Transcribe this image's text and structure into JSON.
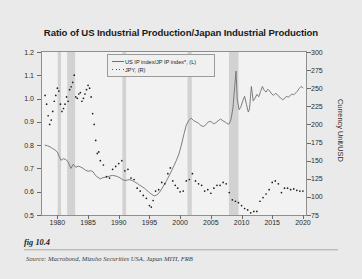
{
  "figure": {
    "caption": "fig 10.4",
    "source": "Source:  Macrobond, Mizuho Securities USA, Japan MITI, FRB"
  },
  "legend": [
    {
      "label": "US IP index/JP IP index*, (L)",
      "key": "line",
      "color": "#707070"
    },
    {
      "label": "JPY, (R)",
      "key": "dots",
      "color": "#1c1c1c"
    }
  ],
  "chart_data": {
    "type": "line",
    "title": "Ratio of US Industrial Production/Japan Industrial Production",
    "xlabel": "",
    "ylabel": "Ratio",
    "y2label": "Currency Unit/USD",
    "xlim": [
      1977.5,
      2020.5
    ],
    "ylim": [
      0.5,
      1.2
    ],
    "y2lim": [
      75,
      300
    ],
    "grid": false,
    "legend_position": "top-center",
    "xticks": [
      "1980",
      "1985",
      "1990",
      "1995",
      "2000",
      "2005",
      "2010",
      "2015",
      "2020"
    ],
    "xtick_values": [
      1980,
      1985,
      1990,
      1995,
      2000,
      2005,
      2010,
      2015,
      2020
    ],
    "yticks": [
      "1.2",
      "1.1",
      "1.0",
      "0.9",
      "0.8",
      "0.7",
      "0.6",
      "0.5"
    ],
    "ytick_values": [
      1.2,
      1.1,
      1.0,
      0.9,
      0.8,
      0.7,
      0.6,
      0.5
    ],
    "y2ticks": [
      "300",
      "275",
      "250",
      "225",
      "200",
      "175",
      "150",
      "125",
      "100",
      "75"
    ],
    "y2tick_values": [
      300,
      275,
      250,
      225,
      200,
      175,
      150,
      125,
      100,
      75
    ],
    "shaded_bands": [
      {
        "name": "recession-1980",
        "x0": 1980.05,
        "x1": 1980.6
      },
      {
        "name": "recession-1981-82",
        "x0": 1981.6,
        "x1": 1982.9
      },
      {
        "name": "recession-1990-91",
        "x0": 1990.6,
        "x1": 1991.2
      },
      {
        "name": "recession-2001",
        "x0": 2001.2,
        "x1": 2001.9
      },
      {
        "name": "recession-2008-09",
        "x0": 2007.95,
        "x1": 2009.5
      }
    ],
    "series": [
      {
        "name": "US IP index/JP IP index*, (L)",
        "axis": "left",
        "style": "line",
        "color": "#707070",
        "x": [
          1978.0,
          1978.4,
          1978.8,
          1979.2,
          1979.6,
          1980.0,
          1980.3,
          1980.6,
          1981.0,
          1981.4,
          1981.8,
          1982.2,
          1982.6,
          1983.0,
          1983.4,
          1983.8,
          1984.2,
          1984.6,
          1985.0,
          1985.4,
          1985.8,
          1986.2,
          1986.6,
          1987.0,
          1987.4,
          1987.8,
          1988.2,
          1988.6,
          1989.0,
          1989.4,
          1989.8,
          1990.2,
          1990.6,
          1991.0,
          1991.4,
          1991.8,
          1992.2,
          1992.6,
          1993.0,
          1993.4,
          1993.8,
          1994.2,
          1994.6,
          1995.0,
          1995.4,
          1995.8,
          1996.2,
          1996.6,
          1997.0,
          1997.4,
          1997.8,
          1998.2,
          1998.6,
          1999.0,
          1999.4,
          1999.8,
          2000.2,
          2000.6,
          2001.0,
          2001.4,
          2001.8,
          2002.2,
          2002.6,
          2003.0,
          2003.4,
          2003.8,
          2004.2,
          2004.6,
          2005.0,
          2005.4,
          2005.8,
          2006.2,
          2006.6,
          2007.0,
          2007.4,
          2007.8,
          2008.0,
          2008.3,
          2008.6,
          2008.9,
          2009.1,
          2009.3,
          2009.6,
          2009.9,
          2010.2,
          2010.5,
          2010.8,
          2011.1,
          2011.3,
          2011.6,
          2011.9,
          2012.2,
          2012.5,
          2012.8,
          2013.1,
          2013.4,
          2013.7,
          2014.0,
          2014.3,
          2014.6,
          2014.9,
          2015.2,
          2015.5,
          2015.8,
          2016.1,
          2016.4,
          2016.7,
          2017.0,
          2017.3,
          2017.6,
          2017.9,
          2018.2,
          2018.5,
          2018.8,
          2019.1,
          2019.4,
          2019.7,
          2020.0
        ],
        "y": [
          0.8,
          0.797,
          0.793,
          0.786,
          0.78,
          0.77,
          0.752,
          0.735,
          0.742,
          0.738,
          0.726,
          0.7,
          0.718,
          0.705,
          0.71,
          0.706,
          0.7,
          0.692,
          0.688,
          0.69,
          0.686,
          0.67,
          0.662,
          0.655,
          0.66,
          0.662,
          0.664,
          0.668,
          0.67,
          0.668,
          0.665,
          0.66,
          0.652,
          0.648,
          0.65,
          0.652,
          0.648,
          0.642,
          0.636,
          0.628,
          0.622,
          0.615,
          0.605,
          0.596,
          0.588,
          0.582,
          0.586,
          0.596,
          0.612,
          0.63,
          0.648,
          0.668,
          0.69,
          0.712,
          0.735,
          0.762,
          0.8,
          0.845,
          0.886,
          0.906,
          0.916,
          0.905,
          0.9,
          0.894,
          0.884,
          0.88,
          0.888,
          0.9,
          0.902,
          0.892,
          0.896,
          0.905,
          0.912,
          0.904,
          0.898,
          0.89,
          0.892,
          0.912,
          0.96,
          1.055,
          1.118,
          0.998,
          0.952,
          0.965,
          0.99,
          1.01,
          0.975,
          0.942,
          0.956,
          1.052,
          0.99,
          1.002,
          1.018,
          1.008,
          1.03,
          1.052,
          1.035,
          1.028,
          1.04,
          1.032,
          1.02,
          1.014,
          1.022,
          1.018,
          1.008,
          1.002,
          0.995,
          1.0,
          1.01,
          1.006,
          1.012,
          1.02,
          1.016,
          1.024,
          1.032,
          1.044,
          1.052,
          1.046
        ]
      },
      {
        "name": "JPY, (R)",
        "axis": "right",
        "style": "dots",
        "color": "#1c1c1c",
        "x": [
          1978.0,
          1978.25,
          1978.5,
          1978.75,
          1979.0,
          1979.25,
          1979.5,
          1979.75,
          1980.0,
          1980.25,
          1980.5,
          1980.75,
          1981.0,
          1981.25,
          1981.5,
          1981.75,
          1982.0,
          1982.25,
          1982.5,
          1982.75,
          1983.0,
          1983.25,
          1983.5,
          1983.75,
          1984.0,
          1984.25,
          1984.5,
          1984.75,
          1985.0,
          1985.25,
          1985.5,
          1985.75,
          1986.0,
          1986.25,
          1986.5,
          1986.75,
          1987.0,
          1987.5,
          1988.0,
          1988.5,
          1989.0,
          1989.5,
          1990.0,
          1990.5,
          1991.0,
          1991.5,
          1992.0,
          1992.5,
          1993.0,
          1993.5,
          1994.0,
          1994.5,
          1995.0,
          1995.3,
          1995.6,
          1996.0,
          1996.5,
          1997.0,
          1997.5,
          1998.0,
          1998.4,
          1998.8,
          1999.2,
          1999.6,
          2000.0,
          2000.5,
          2001.0,
          2001.5,
          2002.0,
          2002.5,
          2003.0,
          2003.5,
          2004.0,
          2004.5,
          2005.0,
          2005.5,
          2006.0,
          2006.5,
          2007.0,
          2007.5,
          2008.0,
          2008.5,
          2009.0,
          2009.5,
          2010.0,
          2010.5,
          2011.0,
          2011.5,
          2012.0,
          2012.5,
          2013.0,
          2013.5,
          2014.0,
          2014.5,
          2015.0,
          2015.5,
          2016.0,
          2016.5,
          2017.0,
          2017.5,
          2018.0,
          2018.5,
          2019.0,
          2019.5,
          2020.0
        ],
        "y": [
          240,
          228,
          212,
          200,
          206,
          218,
          232,
          240,
          250,
          246,
          228,
          218,
          222,
          228,
          238,
          232,
          248,
          252,
          258,
          268,
          238,
          236,
          242,
          244,
          232,
          236,
          242,
          248,
          254,
          250,
          238,
          215,
          200,
          178,
          160,
          162,
          150,
          144,
          128,
          126,
          138,
          142,
          146,
          150,
          136,
          138,
          126,
          124,
          112,
          108,
          102,
          98,
          88,
          86,
          95,
          108,
          110,
          120,
          118,
          132,
          140,
          122,
          116,
          112,
          107,
          108,
          122,
          124,
          132,
          122,
          118,
          116,
          108,
          110,
          105,
          112,
          116,
          116,
          120,
          118,
          106,
          96,
          94,
          92,
          88,
          84,
          82,
          78,
          80,
          80,
          94,
          99,
          104,
          110,
          120,
          122,
          118,
          106,
          112,
          112,
          110,
          111,
          109,
          108,
          108
        ]
      }
    ]
  }
}
